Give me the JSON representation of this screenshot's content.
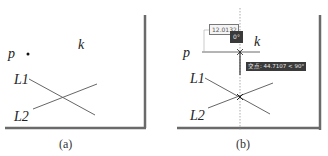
{
  "panels": [
    {
      "id": "a",
      "caption": "(a)",
      "labels": {
        "p": "p",
        "k": "k",
        "L1": "L1",
        "L2": "L2"
      }
    },
    {
      "id": "b",
      "caption": "(b)",
      "labels": {
        "p": "p",
        "k": "k",
        "L1": "L1",
        "L2": "L2"
      },
      "dynamic_input_value": "12.0132",
      "angle_box": "0°",
      "tracking_tooltip": "交点: 44.7107 < 90°"
    }
  ],
  "colors": {
    "line": "#555555",
    "frame_shadow": "#6a6a6a",
    "tooltip_bg": "#3a3a3a"
  }
}
